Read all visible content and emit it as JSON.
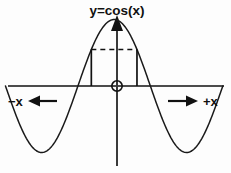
{
  "figure": {
    "title": "y=cos(x)",
    "background_color": "#fdfdfd",
    "ink_color": "#111111",
    "axis_left_label": "−x",
    "axis_right_label": "+x",
    "origin_marker": "origin-circle"
  },
  "chart_data": {
    "type": "line",
    "title": "y=cos(x)",
    "xlabel": "x",
    "ylabel": "y",
    "legend": [],
    "grid": false,
    "annotations": [
      {
        "name": "left-direction-arrow",
        "label": "−x",
        "direction": "left"
      },
      {
        "name": "right-direction-arrow",
        "label": "+x",
        "direction": "right"
      },
      {
        "name": "origin-marker",
        "label": "",
        "shape": "circle"
      },
      {
        "name": "amplitude-dashed-line",
        "label": "",
        "style": "dashed-horizontal"
      },
      {
        "name": "left-drop-line",
        "label": "",
        "style": "solid-vertical"
      },
      {
        "name": "right-drop-line",
        "label": "",
        "style": "solid-vertical"
      }
    ],
    "xlim": [
      -4.71238898,
      4.71238898
    ],
    "ylim": [
      -1.15,
      1.15
    ],
    "x": [
      -4.712389,
      -4.48799,
      -4.263591,
      -4.039191,
      -3.814792,
      -3.590392,
      -3.365993,
      -3.141593,
      -2.917194,
      -2.692794,
      -2.468395,
      -2.243995,
      -2.019596,
      -1.795196,
      -1.570796,
      -1.346397,
      -1.121997,
      -0.897598,
      -0.673198,
      -0.448799,
      -0.224399,
      0.0,
      0.224399,
      0.448799,
      0.673198,
      0.897598,
      1.121997,
      1.346397,
      1.570796,
      1.795196,
      2.019596,
      2.243995,
      2.468395,
      2.692794,
      2.917194,
      3.141593,
      3.365993,
      3.590392,
      3.814792,
      4.039191,
      4.263591,
      4.48799,
      4.712389
    ],
    "y": [
      0.0,
      0.2225,
      0.4339,
      0.6235,
      0.7818,
      0.901,
      0.9749,
      1.0,
      0.9749,
      0.901,
      0.7818,
      0.6235,
      0.4339,
      0.2225,
      0.0,
      -0.2225,
      -0.4339,
      -0.6235,
      -0.7818,
      -0.901,
      -0.9749,
      -1.0,
      -0.9749,
      -0.901,
      -0.7818,
      -0.6235,
      -0.4339,
      -0.2225,
      0.0,
      0.2225,
      0.4339,
      0.6235,
      0.7818,
      0.901,
      0.9749,
      1.0,
      0.9749,
      0.901,
      0.7818,
      0.6235,
      0.4339,
      0.2225,
      0.0
    ],
    "series": [
      {
        "name": "y=cos(x)",
        "color": "#1a1a1a",
        "style": "solid"
      }
    ],
    "marked_interval": {
      "y_level": 0.55,
      "x_left": -0.99,
      "x_right": 0.99
    },
    "zero_crossings": [
      -1.570796,
      1.570796
    ],
    "maxima": [
      {
        "x": 0.0,
        "y": 1.0
      }
    ],
    "minima": [
      {
        "x": -3.141593,
        "y": -1.0
      },
      {
        "x": 3.141593,
        "y": -1.0
      }
    ]
  }
}
